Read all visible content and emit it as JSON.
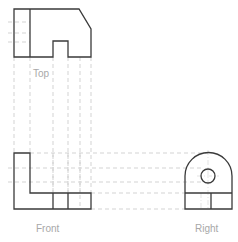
{
  "drawing": {
    "type": "orthographic-projection",
    "views": [
      {
        "id": "top",
        "label": "Top"
      },
      {
        "id": "front",
        "label": "Front"
      },
      {
        "id": "right",
        "label": "Right"
      }
    ],
    "colors": {
      "outline": "#3a3a3a",
      "projection": "#c8c8c8",
      "label": "#a8a8a8",
      "background": "#ffffff"
    }
  },
  "labels": {
    "top": "Top",
    "front": "Front",
    "right": "Right"
  }
}
